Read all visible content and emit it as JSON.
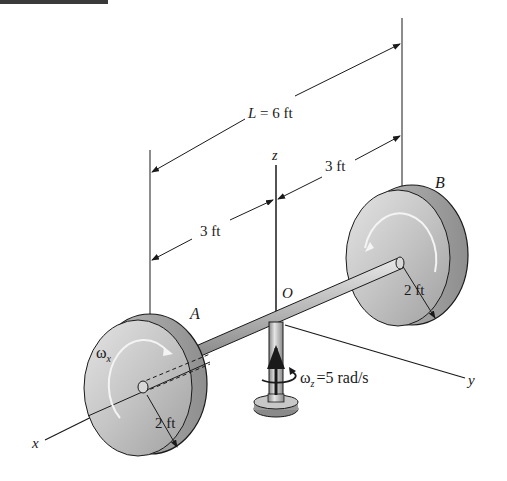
{
  "figure": {
    "type": "engineering-dynamics-diagram"
  },
  "labels": {
    "length_total": "L = 6 ft",
    "dim_left": "3 ft",
    "dim_right": "3 ft",
    "disk_a": "A",
    "disk_b": "B",
    "radius_a": "2 ft",
    "radius_b": "2 ft",
    "origin": "O",
    "axis_x": "x",
    "axis_y": "y",
    "axis_z": "z",
    "omega_x_symbol": "ω",
    "omega_x_sub": "x",
    "omega_z_symbol": "ω",
    "omega_z_sub": "z",
    "omega_z_value": "=5 rad/s"
  },
  "colors": {
    "line": "#1a1a1a",
    "disk_face": "#c8c8c8",
    "disk_rim": "#a8a8a8",
    "shaft": "#b5b5b5",
    "topbar": "#3a3a3a"
  }
}
